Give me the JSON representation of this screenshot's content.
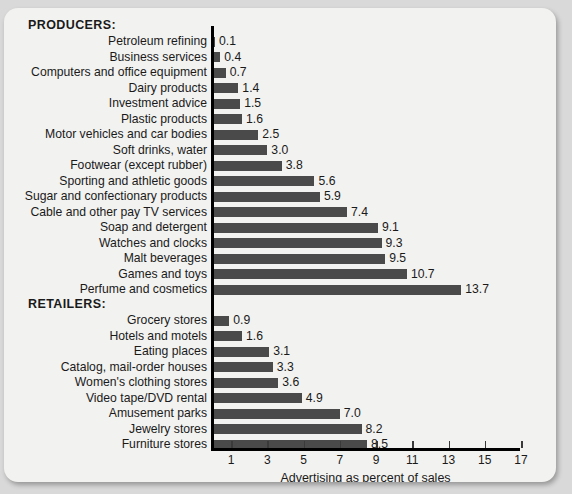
{
  "chart_data": {
    "type": "bar",
    "orientation": "horizontal",
    "title": "",
    "xlabel": "Advertising as percent of sales",
    "ylabel": "",
    "xlim": [
      0,
      17
    ],
    "xticks": [
      1,
      3,
      5,
      7,
      9,
      11,
      13,
      15,
      17
    ],
    "grid": false,
    "legend": null,
    "bar_color": "#4a4a4a",
    "background_color": "#f2f2f0",
    "groups": [
      {
        "name": "PRODUCERS:",
        "categories": [
          "Petroleum refining",
          "Business services",
          "Computers and office equipment",
          "Dairy products",
          "Investment advice",
          "Plastic products",
          "Motor vehicles and car bodies",
          "Soft drinks, water",
          "Footwear (except rubber)",
          "Sporting and athletic goods",
          "Sugar and confectionary products",
          "Cable and other pay TV services",
          "Soap and detergent",
          "Watches and clocks",
          "Malt beverages",
          "Games and toys",
          "Perfume and cosmetics"
        ],
        "values": [
          0.1,
          0.4,
          0.7,
          1.4,
          1.5,
          1.6,
          2.5,
          3.0,
          3.8,
          5.6,
          5.9,
          7.4,
          9.1,
          9.3,
          9.5,
          10.7,
          13.7
        ],
        "value_labels": [
          "0.1",
          "0.4",
          "0.7",
          "1.4",
          "1.5",
          "1.6",
          "2.5",
          "3.0",
          "3.8",
          "5.6",
          "5.9",
          "7.4",
          "9.1",
          "9.3",
          "9.5",
          "10.7",
          "13.7"
        ]
      },
      {
        "name": "RETAILERS:",
        "categories": [
          "Grocery stores",
          "Hotels and motels",
          "Eating places",
          "Catalog, mail-order houses",
          "Women's clothing stores",
          "Video tape/DVD rental",
          "Amusement parks",
          "Jewelry stores",
          "Furniture stores"
        ],
        "values": [
          0.9,
          1.6,
          3.1,
          3.3,
          3.6,
          4.9,
          7.0,
          8.2,
          8.5
        ],
        "value_labels": [
          "0.9",
          "1.6",
          "3.1",
          "3.3",
          "3.6",
          "4.9",
          "7.0",
          "8.2",
          "8.5"
        ]
      }
    ]
  }
}
